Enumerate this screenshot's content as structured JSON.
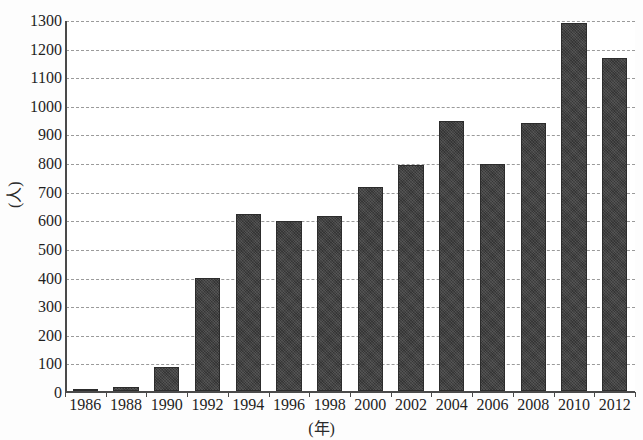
{
  "chart_data": {
    "type": "bar",
    "title": "",
    "xlabel": "(年)",
    "ylabel": "(人)",
    "categories": [
      "1986",
      "1988",
      "1990",
      "1992",
      "1994",
      "1996",
      "1998",
      "2000",
      "2002",
      "2004",
      "2006",
      "2008",
      "2010",
      "2012"
    ],
    "values": [
      3,
      15,
      85,
      395,
      620,
      595,
      612,
      712,
      790,
      945,
      793,
      935,
      1285,
      1163
    ],
    "ylim": [
      0,
      1300
    ],
    "ytick_labels": [
      "0",
      "100",
      "200",
      "300",
      "400",
      "500",
      "600",
      "700",
      "800",
      "900",
      "1000",
      "1100",
      "1200",
      "1300"
    ],
    "ytick_values": [
      0,
      100,
      200,
      300,
      400,
      500,
      600,
      700,
      800,
      900,
      1000,
      1100,
      1200,
      1300
    ],
    "grid": "horizontal-dashed",
    "legend": "none",
    "bar_color": "#3c3c3c",
    "axis_color": "#4a4a4a",
    "grid_color": "#9a9a9a",
    "background_color": "#ffffff"
  }
}
